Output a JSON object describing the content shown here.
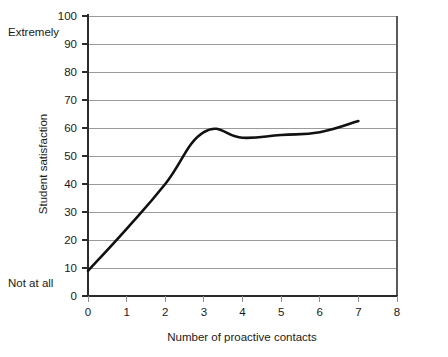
{
  "chart_data": {
    "type": "line",
    "title": "",
    "xlabel": "Number of proactive contacts",
    "ylabel": "Student satisfaction",
    "x": [
      0,
      1,
      2,
      3,
      4,
      5,
      6,
      7
    ],
    "values": [
      9,
      24,
      40,
      58.5,
      56.5,
      57.5,
      58.5,
      62.5
    ],
    "series": [
      {
        "name": "Student satisfaction",
        "values": [
          9,
          24,
          40,
          58.5,
          56.5,
          57.5,
          58.5,
          62.5
        ]
      }
    ],
    "xlim": [
      0,
      8
    ],
    "ylim": [
      0,
      100
    ],
    "xticks": [
      "0",
      "1",
      "2",
      "3",
      "4",
      "5",
      "6",
      "7",
      "8"
    ],
    "yticks": [
      "0",
      "10",
      "20",
      "30",
      "40",
      "50",
      "60",
      "70",
      "80",
      "90",
      "100"
    ],
    "grid": "horizontal",
    "legend": "none",
    "annotations": [
      {
        "text": "Extremely",
        "y_value": 95,
        "position": "left-outside"
      },
      {
        "text": "Not at all",
        "y_value": 5,
        "position": "left-outside"
      }
    ],
    "line_color": "#111111",
    "grid_color": "#9a9a9a",
    "background_color": "#ffffff"
  }
}
